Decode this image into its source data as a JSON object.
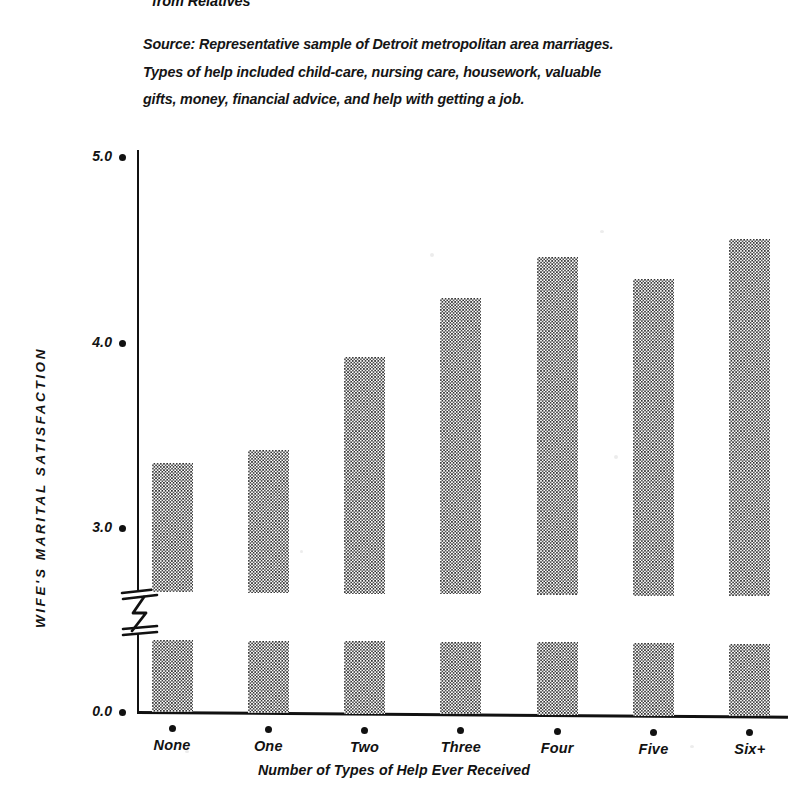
{
  "header": {
    "title_fragment": "from Relatives"
  },
  "source_note": {
    "lines": [
      "Source: Representative sample of Detroit metropolitan area  marriages.",
      "Types of help included child-care, nursing care, housework, valuable",
      "gifts, money, financial advice, and help with getting a job."
    ]
  },
  "chart_data": {
    "type": "bar",
    "title": "from Relatives",
    "xlabel": "Number of Types of Help Ever Received",
    "ylabel": "WIFE'S MARITAL SATISFACTION",
    "categories": [
      "None",
      "One",
      "Two",
      "Three",
      "Four",
      "Five",
      "Six+"
    ],
    "values": [
      3.35,
      3.42,
      3.92,
      4.24,
      4.46,
      4.34,
      4.56
    ],
    "ytick_labels": [
      "5.0",
      "4.0",
      "3.0",
      "0.0"
    ],
    "ytick_values": [
      5.0,
      4.0,
      3.0,
      0.0
    ],
    "ylim": [
      0.0,
      5.2
    ],
    "axis_break": true,
    "axis_break_between": [
      0.0,
      3.0
    ],
    "grid": false,
    "legend": null,
    "bar_fill": "halftone-checker-gray",
    "bar_fill_color": "#2b2b2b",
    "axis_color": "#111111"
  },
  "axis": {
    "y_title": "WIFE'S MARITAL SATISFACTION",
    "x_title": "Number of Types of Help Ever Received"
  }
}
